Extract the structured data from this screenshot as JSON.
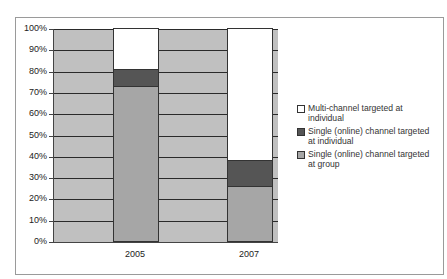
{
  "chart_data": {
    "type": "bar",
    "stacked": true,
    "percent_stacked": true,
    "title": "",
    "xlabel": "",
    "ylabel": "",
    "categories": [
      "2005",
      "2007"
    ],
    "series": [
      {
        "name": "Single (online) channel targeted at group",
        "values": [
          73,
          26
        ],
        "color": "#a6a6a6"
      },
      {
        "name": "Single (online) channel targeted at individual",
        "values": [
          8,
          12
        ],
        "color": "#555555"
      },
      {
        "name": "Multi-channel targeted at individual",
        "values": [
          19,
          62
        ],
        "color": "#ffffff"
      }
    ],
    "ylim": [
      0,
      100
    ],
    "yticks": [
      "0%",
      "10%",
      "20%",
      "30%",
      "40%",
      "50%",
      "60%",
      "70%",
      "80%",
      "90%",
      "100%"
    ],
    "grid": true,
    "plot_background": "#c0c0c0",
    "legend_position": "right",
    "legend_order": [
      "Multi-channel targeted at individual",
      "Single (online) channel targeted at individual",
      "Single (online) channel targeted at group"
    ]
  },
  "legend": {
    "items": [
      {
        "label": "Multi-channel targeted at individual",
        "color": "#ffffff"
      },
      {
        "label": "Single (online) channel targeted at individual",
        "color": "#555555"
      },
      {
        "label": "Single (online) channel targeted at group",
        "color": "#a6a6a6"
      }
    ]
  }
}
